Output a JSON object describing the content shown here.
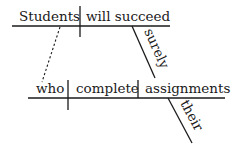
{
  "diagram": {
    "type": "sentence-diagram",
    "main_clause": {
      "subject": "Students",
      "predicate": "will succeed",
      "modifiers": [
        {
          "word": "surely",
          "modifies": "will succeed"
        }
      ]
    },
    "relative_clause": {
      "subject": "who",
      "verb": "complete",
      "object": "assignments",
      "modifiers": [
        {
          "word": "their",
          "modifies": "assignments"
        }
      ],
      "connects_to": "Students"
    }
  }
}
